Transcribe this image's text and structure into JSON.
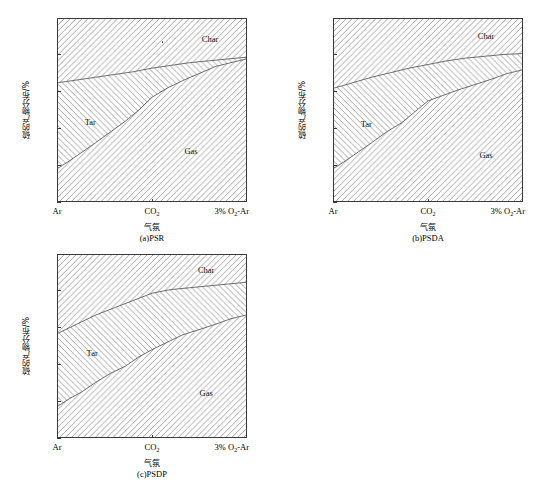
{
  "figure": {
    "y_axis_title": "硫的产物分布/%",
    "x_axis_title": "气氛",
    "y_ticks": [
      "0",
      "20",
      "40",
      "60",
      "80",
      "100"
    ],
    "x_ticks": [
      "Ar",
      "CO",
      "3% O",
      "-Ar"
    ],
    "x_tick_ar": "Ar",
    "x_tick_co2_base": "CO",
    "x_tick_co2_sub": "2",
    "x_tick_o2ar_pre": "3% O",
    "x_tick_o2ar_sub": "2",
    "x_tick_o2ar_post": "-Ar",
    "region_labels": {
      "char": "Char",
      "tar": "Tar",
      "gas": "Gas"
    },
    "colors": {
      "axis": "#3a3a3a",
      "hatch": "#9a9a9a",
      "boundary": "#4a4a4a",
      "text": "#000000"
    }
  },
  "chart_data": [
    {
      "type": "area",
      "id": "psr",
      "title": "(a)PSR",
      "caption": "(a)PSR",
      "xlabel": "气氛",
      "ylabel": "硫的产物分布/%",
      "categories": [
        "Ar",
        "CO2",
        "3% O2-Ar"
      ],
      "x": [
        0,
        0.5,
        1
      ],
      "ylim": [
        0,
        100
      ],
      "yticks": [
        0,
        20,
        40,
        60,
        80,
        100
      ],
      "grid": false,
      "legend": "in-plot region labels",
      "stacked": true,
      "series": [
        {
          "name": "Gas",
          "values": [
            18,
            57,
            78
          ],
          "hatch": "forward-slash",
          "curve": [
            [
              0,
              18
            ],
            [
              0.06,
              22
            ],
            [
              0.13,
              27
            ],
            [
              0.2,
              32
            ],
            [
              0.28,
              38
            ],
            [
              0.36,
              44
            ],
            [
              0.43,
              50
            ],
            [
              0.5,
              57
            ],
            [
              0.58,
              62
            ],
            [
              0.66,
              66
            ],
            [
              0.75,
              70
            ],
            [
              0.84,
              74
            ],
            [
              0.92,
              76
            ],
            [
              1,
              78
            ]
          ]
        },
        {
          "name": "Tar",
          "values": [
            47,
            16,
            1
          ],
          "hatch": "back-slash",
          "cumulative_curve": [
            [
              0,
              65
            ],
            [
              0.1,
              66.5
            ],
            [
              0.2,
              68
            ],
            [
              0.3,
              69.5
            ],
            [
              0.4,
              71
            ],
            [
              0.5,
              73
            ],
            [
              0.6,
              74.5
            ],
            [
              0.7,
              76
            ],
            [
              0.8,
              77
            ],
            [
              0.9,
              78
            ],
            [
              1,
              79
            ]
          ]
        },
        {
          "name": "Char",
          "values": [
            35,
            27,
            21
          ],
          "hatch": "forward-slash",
          "cumulative_curve": [
            [
              0,
              100
            ],
            [
              1,
              100
            ]
          ]
        }
      ],
      "boundaries": {
        "gas_top": [
          [
            0,
            18
          ],
          [
            0.06,
            22
          ],
          [
            0.13,
            27
          ],
          [
            0.2,
            32
          ],
          [
            0.28,
            38
          ],
          [
            0.36,
            44
          ],
          [
            0.43,
            50
          ],
          [
            0.5,
            57
          ],
          [
            0.58,
            62
          ],
          [
            0.66,
            66
          ],
          [
            0.75,
            70
          ],
          [
            0.84,
            74
          ],
          [
            0.92,
            76
          ],
          [
            1,
            78
          ]
        ],
        "tar_top": [
          [
            0,
            65
          ],
          [
            0.1,
            66.5
          ],
          [
            0.2,
            68
          ],
          [
            0.3,
            69.5
          ],
          [
            0.4,
            71
          ],
          [
            0.5,
            73
          ],
          [
            0.6,
            74.5
          ],
          [
            0.7,
            76
          ],
          [
            0.8,
            77
          ],
          [
            0.9,
            78
          ],
          [
            1,
            79
          ]
        ]
      },
      "label_positions": {
        "char": [
          0.8,
          89
        ],
        "tar": [
          0.17,
          44
        ],
        "gas": [
          0.7,
          28
        ]
      },
      "artifact_dot": [
        0.545,
        88
      ]
    },
    {
      "type": "area",
      "id": "psda",
      "title": "(b)PSDA",
      "caption": "(b)PSDA",
      "xlabel": "气氛",
      "ylabel": "硫的产物分布/%",
      "categories": [
        "Ar",
        "CO2",
        "3% O2-Ar"
      ],
      "x": [
        0,
        0.5,
        1
      ],
      "ylim": [
        0,
        100
      ],
      "yticks": [
        0,
        20,
        40,
        60,
        80,
        100
      ],
      "grid": false,
      "legend": "in-plot region labels",
      "stacked": true,
      "series": [
        {
          "name": "Gas",
          "values": [
            18,
            55,
            72
          ],
          "hatch": "forward-slash",
          "curve": [
            [
              0,
              18
            ],
            [
              0.06,
              22
            ],
            [
              0.13,
              27
            ],
            [
              0.2,
              32
            ],
            [
              0.28,
              38
            ],
            [
              0.36,
              43
            ],
            [
              0.43,
              49
            ],
            [
              0.5,
              55
            ],
            [
              0.58,
              58
            ],
            [
              0.66,
              61
            ],
            [
              0.75,
              64
            ],
            [
              0.84,
              67
            ],
            [
              0.92,
              70
            ],
            [
              1,
              72
            ]
          ]
        },
        {
          "name": "Tar",
          "values": [
            44,
            20,
            9
          ],
          "hatch": "back-slash",
          "cumulative_curve": [
            [
              0,
              62
            ],
            [
              0.1,
              65
            ],
            [
              0.2,
              68
            ],
            [
              0.3,
              70.5
            ],
            [
              0.4,
              73
            ],
            [
              0.5,
              75
            ],
            [
              0.6,
              77
            ],
            [
              0.7,
              78.5
            ],
            [
              0.8,
              79.5
            ],
            [
              0.9,
              80.5
            ],
            [
              1,
              81
            ]
          ]
        },
        {
          "name": "Char",
          "values": [
            38,
            25,
            19
          ],
          "hatch": "forward-slash",
          "cumulative_curve": [
            [
              0,
              100
            ],
            [
              1,
              100
            ]
          ]
        }
      ],
      "boundaries": {
        "gas_top": [
          [
            0,
            18
          ],
          [
            0.06,
            22
          ],
          [
            0.13,
            27
          ],
          [
            0.2,
            32
          ],
          [
            0.28,
            38
          ],
          [
            0.36,
            43
          ],
          [
            0.43,
            49
          ],
          [
            0.5,
            55
          ],
          [
            0.58,
            58
          ],
          [
            0.66,
            61
          ],
          [
            0.75,
            64
          ],
          [
            0.84,
            67
          ],
          [
            0.92,
            70
          ],
          [
            1,
            72
          ]
        ],
        "tar_top": [
          [
            0,
            62
          ],
          [
            0.1,
            65
          ],
          [
            0.2,
            68
          ],
          [
            0.3,
            70.5
          ],
          [
            0.4,
            73
          ],
          [
            0.5,
            75
          ],
          [
            0.6,
            77
          ],
          [
            0.7,
            78.5
          ],
          [
            0.8,
            79.5
          ],
          [
            0.9,
            80.5
          ],
          [
            1,
            81
          ]
        ]
      },
      "label_positions": {
        "char": [
          0.8,
          91
        ],
        "tar": [
          0.17,
          43
        ],
        "gas": [
          0.8,
          26
        ]
      },
      "artifact_dot": null
    },
    {
      "type": "area",
      "id": "psdp",
      "title": "(c)PSDP",
      "caption": "(c)PSDP",
      "xlabel": "气氛",
      "ylabel": "硫的产物分布/%",
      "categories": [
        "Ar",
        "CO2",
        "3% O2-Ar"
      ],
      "x": [
        0,
        0.5,
        1
      ],
      "ylim": [
        0,
        100
      ],
      "yticks": [
        0,
        20,
        40,
        60,
        80,
        100
      ],
      "grid": false,
      "legend": "in-plot region labels",
      "stacked": true,
      "series": [
        {
          "name": "Gas",
          "values": [
            17,
            48,
            67
          ],
          "hatch": "forward-slash",
          "curve": [
            [
              0,
              17
            ],
            [
              0.06,
              21
            ],
            [
              0.13,
              25
            ],
            [
              0.2,
              30
            ],
            [
              0.28,
              35
            ],
            [
              0.36,
              39
            ],
            [
              0.43,
              44
            ],
            [
              0.5,
              48
            ],
            [
              0.58,
              52
            ],
            [
              0.66,
              56
            ],
            [
              0.75,
              59
            ],
            [
              0.84,
              62
            ],
            [
              0.92,
              65
            ],
            [
              1,
              67
            ]
          ]
        },
        {
          "name": "Tar",
          "values": [
            40,
            32,
            18
          ],
          "hatch": "back-slash",
          "cumulative_curve": [
            [
              0,
              57
            ],
            [
              0.1,
              62
            ],
            [
              0.2,
              67
            ],
            [
              0.3,
              71
            ],
            [
              0.4,
              75
            ],
            [
              0.5,
              79
            ],
            [
              0.6,
              81
            ],
            [
              0.7,
              82
            ],
            [
              0.8,
              83
            ],
            [
              0.9,
              84
            ],
            [
              1,
              85
            ]
          ]
        },
        {
          "name": "Char",
          "values": [
            43,
            21,
            15
          ],
          "hatch": "forward-slash",
          "cumulative_curve": [
            [
              0,
              100
            ],
            [
              1,
              100
            ]
          ]
        }
      ],
      "boundaries": {
        "gas_top": [
          [
            0,
            17
          ],
          [
            0.06,
            21
          ],
          [
            0.13,
            25
          ],
          [
            0.2,
            30
          ],
          [
            0.28,
            35
          ],
          [
            0.36,
            39
          ],
          [
            0.43,
            44
          ],
          [
            0.5,
            48
          ],
          [
            0.58,
            52
          ],
          [
            0.66,
            56
          ],
          [
            0.75,
            59
          ],
          [
            0.84,
            62
          ],
          [
            0.92,
            65
          ],
          [
            1,
            67
          ]
        ],
        "tar_top": [
          [
            0,
            57
          ],
          [
            0.1,
            62
          ],
          [
            0.2,
            67
          ],
          [
            0.3,
            71
          ],
          [
            0.4,
            75
          ],
          [
            0.5,
            79
          ],
          [
            0.6,
            81
          ],
          [
            0.7,
            82
          ],
          [
            0.8,
            83
          ],
          [
            0.9,
            84
          ],
          [
            1,
            85
          ]
        ]
      },
      "label_positions": {
        "char": [
          0.78,
          92
        ],
        "tar": [
          0.18,
          47
        ],
        "gas": [
          0.78,
          25
        ]
      },
      "artifact_dot": null
    }
  ]
}
